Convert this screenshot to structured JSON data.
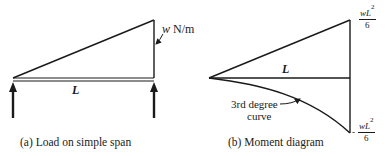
{
  "panel_a": {
    "caption": "(a) Load on simple span",
    "span_label": "L",
    "load_symbol": "w",
    "load_unit": "N/m"
  },
  "panel_b": {
    "caption": "(b) Moment diagram",
    "span_label": "L",
    "curve_label_line1": "3rd degree",
    "curve_label_line2": "curve",
    "top_value_num": "wL",
    "top_value_exp": "2",
    "top_value_den": "6",
    "bottom_value_sign": "-",
    "bottom_value_num": "wL",
    "bottom_value_exp": "2",
    "bottom_value_den": "6"
  },
  "colors": {
    "ink": "#1a1a1a",
    "background": "#ffffff"
  }
}
